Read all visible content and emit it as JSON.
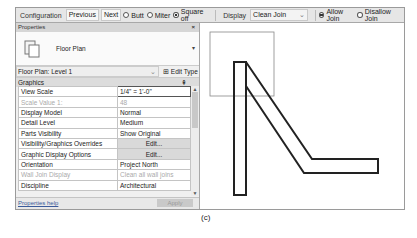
{
  "options_bar": {
    "configuration_label": "Configuration",
    "previous_label": "Previous",
    "next_label": "Next",
    "join_types": [
      {
        "label": "Butt",
        "selected": false
      },
      {
        "label": "Miter",
        "selected": false
      },
      {
        "label": "Square off",
        "selected": true
      }
    ],
    "display_label": "Display",
    "display_value": "Clean Join",
    "allow_join": [
      {
        "label": "Allow Join",
        "selected": true
      },
      {
        "label": "Disallow Join",
        "selected": false
      }
    ]
  },
  "properties": {
    "title": "Properties",
    "close_icon": "×",
    "type_name": "Floor Plan",
    "instance_selector": "Floor Plan: Level 1",
    "edit_type_label": "Edit Type",
    "group": "Graphics",
    "rows": [
      {
        "key": "View Scale",
        "value": "1/4\" = 1'-0\"",
        "dim": false,
        "button": false
      },
      {
        "key": "Scale Value   1:",
        "value": "48",
        "dim": true,
        "button": false
      },
      {
        "key": "Display Model",
        "value": "Normal",
        "dim": false,
        "button": false
      },
      {
        "key": "Detail Level",
        "value": "Medium",
        "dim": false,
        "button": false
      },
      {
        "key": "Parts Visibility",
        "value": "Show Original",
        "dim": false,
        "button": false
      },
      {
        "key": "Visibility/Graphics Overrides",
        "value": "Edit...",
        "dim": false,
        "button": true
      },
      {
        "key": "Graphic Display Options",
        "value": "Edit...",
        "dim": false,
        "button": true
      },
      {
        "key": "Orientation",
        "value": "Project North",
        "dim": false,
        "button": false
      },
      {
        "key": "Wall Join Display",
        "value": "Clean all wall joins",
        "dim": true,
        "button": false
      },
      {
        "key": "Discipline",
        "value": "Architectural",
        "dim": false,
        "button": false
      }
    ],
    "help_link": "Properties help",
    "apply_label": "Apply"
  },
  "caption": "(c)"
}
